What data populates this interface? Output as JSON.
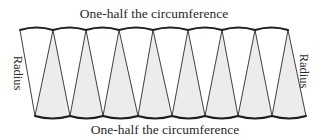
{
  "labels": {
    "top": "One-half the circumference",
    "bottom": "One-half the circumference",
    "left": "Radius",
    "right": "Radius"
  },
  "geometry": {
    "top_vertices_x": [
      20,
      53,
      86,
      119,
      153,
      188,
      222,
      255,
      288
    ],
    "top_y": 30,
    "top_arc_bulge": -2.5,
    "bottom_vertices_x": [
      35,
      70,
      103,
      138,
      172,
      205,
      238,
      272,
      306
    ],
    "bottom_y": 116,
    "bottom_arc_bulge": 2.5,
    "sector_count": 16
  },
  "colors": {
    "shaded_sector": "#ececec",
    "unshaded_sector": "#ffffff",
    "outline": "#1e1e1e",
    "text": "#2a2a2a"
  }
}
